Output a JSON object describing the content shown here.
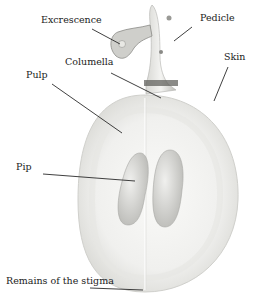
{
  "labels": {
    "excrescence": "Excrescence",
    "pedicle": "Pedicle",
    "columella": "Columella",
    "skin": "Skin",
    "pulp": "Pulp",
    "pip": "Pip",
    "stigma": "Remains of the stigma"
  },
  "colors": {
    "line": "#2a2a2a",
    "pulp": "#f2f2f0",
    "pulp_edge": "#d8d8d4",
    "pip": "#c8c8c4",
    "stem": "#bdbdb8"
  }
}
